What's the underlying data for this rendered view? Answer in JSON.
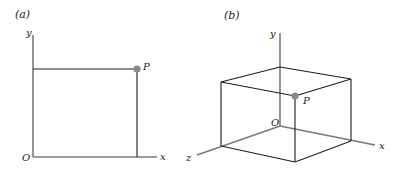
{
  "figure": {
    "panels": [
      {
        "id": "a",
        "label": "(a)",
        "type": "2d-coordinate-plane",
        "axes": {
          "x": "x",
          "y": "y"
        },
        "origin_label": "O",
        "point_label": "P",
        "colors": {
          "axis": "#7a7a7a",
          "edge": "#1e1e1e",
          "point": "#8a8a8a"
        }
      },
      {
        "id": "b",
        "label": "(b)",
        "type": "3d-coordinate-box",
        "axes": {
          "x": "x",
          "y": "y",
          "z": "z"
        },
        "origin_label": "O",
        "point_label": "P",
        "colors": {
          "axis": "#7a7a7a",
          "edge": "#1e1e1e",
          "point": "#8a8a8a"
        }
      }
    ]
  }
}
